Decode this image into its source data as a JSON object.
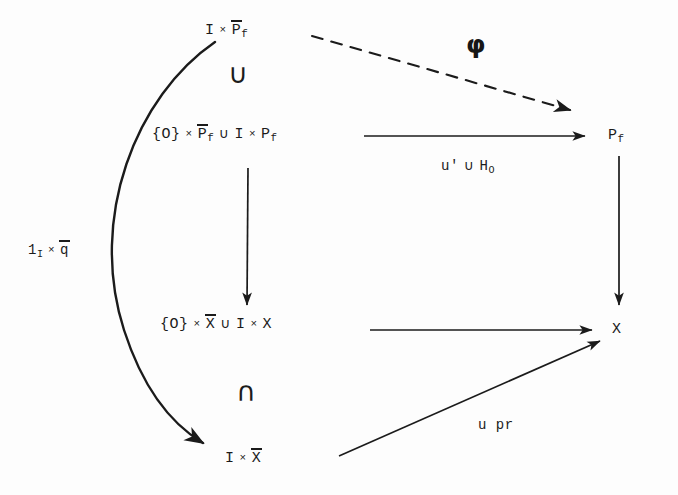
{
  "diagram": {
    "kind": "commutative-diagram",
    "title": "",
    "background_color": "#fdfdfd",
    "ink_color": "#1b1b1b",
    "nodes": [
      {
        "id": "top-left",
        "text": "I × P̄_f",
        "x": 205,
        "y": 22
      },
      {
        "id": "mid-left",
        "text": "{O} × P̄_f ∪ I × P_f",
        "x": 152,
        "y": 126
      },
      {
        "id": "low-left",
        "text": "{O} × X̄ ∪ I × X",
        "x": 160,
        "y": 316
      },
      {
        "id": "bottom-left",
        "text": "I × X̄",
        "x": 225,
        "y": 450
      },
      {
        "id": "top-right",
        "text": "P_f",
        "x": 608,
        "y": 128
      },
      {
        "id": "bottom-right",
        "text": "X",
        "x": 612,
        "y": 322
      }
    ],
    "set_symbols": [
      {
        "id": "union-top",
        "glyph": "∪",
        "x": 228,
        "y": 60
      },
      {
        "id": "intersection-low",
        "glyph": "∩",
        "x": 236,
        "y": 378
      }
    ],
    "arrow_labels": [
      {
        "id": "phi-label",
        "text": "φ",
        "x": 466,
        "y": 32
      },
      {
        "id": "u-union-h",
        "text": "u' ∪ H_O",
        "x": 441,
        "y": 158
      },
      {
        "id": "one-times-qbar",
        "text": "1_I × q̄",
        "x": 28,
        "y": 242
      },
      {
        "id": "u-pr",
        "text": "u pr",
        "x": 478,
        "y": 418
      }
    ],
    "arrows": [
      {
        "id": "phi-arrow",
        "style": "dashed",
        "from": "top-left",
        "to": "top-right"
      },
      {
        "id": "uh-arrow",
        "style": "solid",
        "from": "mid-left",
        "to": "top-right"
      },
      {
        "id": "left-vertical",
        "style": "solid",
        "from": "mid-left",
        "to": "low-left"
      },
      {
        "id": "right-vertical",
        "style": "solid",
        "from": "top-right",
        "to": "bottom-right"
      },
      {
        "id": "lower-horizontal",
        "style": "solid",
        "from": "low-left",
        "to": "bottom-right"
      },
      {
        "id": "u-pr-arrow",
        "style": "solid",
        "from": "bottom-left",
        "to": "bottom-right"
      },
      {
        "id": "curved-arrow",
        "style": "curved",
        "from": "top-left",
        "to": "bottom-left"
      }
    ]
  }
}
